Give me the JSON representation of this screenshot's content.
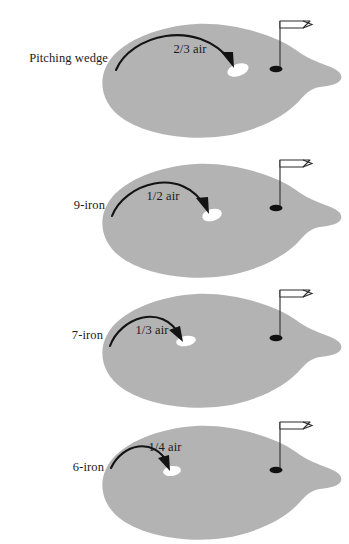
{
  "figure": {
    "type": "diagram",
    "background_color": "#ffffff",
    "green_color": "#b3b3b3",
    "ink_color": "#1a1a1a",
    "landing_spot_color": "#ffffff",
    "panel_count": 4
  },
  "panels": [
    {
      "id": "panel-pitching-wedge",
      "club_label": "Pitching wedge",
      "air_label": "2/3 air",
      "air_fraction": "2/3",
      "club_label_x": 108,
      "club_label_y": 54,
      "air_label_x": 190,
      "air_label_y": 45,
      "arc_start_x": 116,
      "arc_start_y": 62,
      "arc_peak_x": 168,
      "arc_peak_y": 20,
      "arc_end_x": 232,
      "arc_end_y": 57,
      "landing_x": 238,
      "landing_y": 62,
      "landing_rx": 11,
      "landing_ry": 6,
      "landing_rotate": -18,
      "flag_x": 280,
      "hole_x": 276,
      "hole_y": 61
    },
    {
      "id": "panel-9-iron",
      "club_label": "9-iron",
      "air_label": "1/2 air",
      "air_fraction": "1/2",
      "club_label_x": 105,
      "club_label_y": 71,
      "air_label_x": 163,
      "air_label_y": 62,
      "arc_start_x": 112,
      "arc_start_y": 78,
      "arc_peak_x": 158,
      "arc_peak_y": 38,
      "arc_end_x": 206,
      "arc_end_y": 72,
      "landing_x": 212,
      "landing_y": 77,
      "landing_rx": 10,
      "landing_ry": 6,
      "landing_rotate": -15,
      "flag_x": 280,
      "hole_x": 276,
      "hole_y": 70
    },
    {
      "id": "panel-7-iron",
      "club_label": "7-iron",
      "air_label": "1/3 air",
      "air_fraction": "1/3",
      "club_label_x": 103,
      "club_label_y": 71,
      "air_label_x": 152,
      "air_label_y": 66,
      "arc_start_x": 110,
      "arc_start_y": 78,
      "arc_peak_x": 146,
      "arc_peak_y": 44,
      "arc_end_x": 180,
      "arc_end_y": 70,
      "landing_x": 186,
      "landing_y": 73,
      "landing_rx": 10,
      "landing_ry": 5,
      "landing_rotate": -10,
      "flag_x": 280,
      "hole_x": 276,
      "hole_y": 70
    },
    {
      "id": "panel-6-iron",
      "club_label": "6-iron",
      "air_label": "1/4 air",
      "air_fraction": "1/4",
      "club_label_x": 104,
      "club_label_y": 71,
      "air_label_x": 165,
      "air_label_y": 51,
      "arc_start_x": 111,
      "arc_start_y": 68,
      "arc_peak_x": 143,
      "arc_peak_y": 46,
      "arc_end_x": 168,
      "arc_end_y": 67,
      "landing_x": 172,
      "landing_y": 71,
      "landing_rx": 9,
      "landing_ry": 5,
      "landing_rotate": -8,
      "flag_x": 280,
      "hole_x": 276,
      "hole_y": 70
    }
  ],
  "panel_tops": [
    8,
    138,
    268,
    400
  ],
  "green_shape_path": "M 196 16 C 160 18 124 32 110 52 C 96 72 102 96 122 110 C 146 127 190 133 224 128 C 258 123 286 108 300 92 C 306 85 312 80 320 79 C 330 78 339 76 341 71 C 343 65 336 61 328 58 C 318 54 306 50 296 42 C 276 27 232 14 196 16 Z",
  "flag": {
    "pole_height": 48,
    "banner_width": 26,
    "banner_height": 13,
    "notch_depth": 8,
    "description": "swallowtail pennant on thin pole with black oval hole at base"
  }
}
